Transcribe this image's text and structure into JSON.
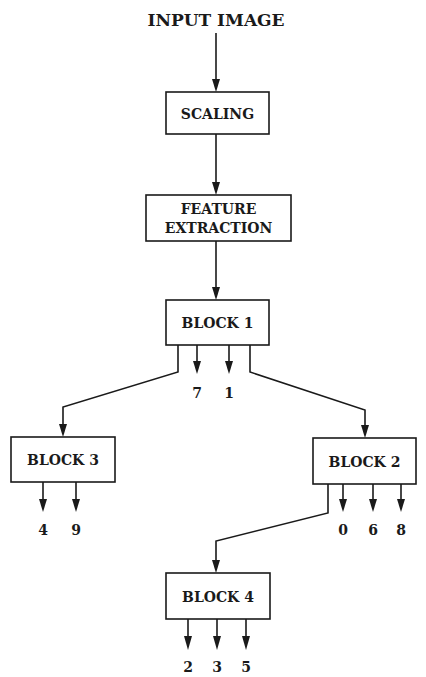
{
  "diagram": {
    "type": "flowchart / decision tree",
    "input_label": "INPUT IMAGE",
    "nodes": {
      "scaling": "SCALING",
      "feature_line1": "FEATURE",
      "feature_line2": "EXTRACTION",
      "block1": "BLOCK 1",
      "block2": "BLOCK 2",
      "block3": "BLOCK 3",
      "block4": "BLOCK 4"
    },
    "outputs": {
      "block1": [
        "7",
        "1"
      ],
      "block3": [
        "4",
        "9"
      ],
      "block2": [
        "0",
        "6",
        "8"
      ],
      "block4": [
        "2",
        "3",
        "5"
      ]
    },
    "edges": [
      {
        "from": "INPUT IMAGE",
        "to": "SCALING"
      },
      {
        "from": "SCALING",
        "to": "FEATURE EXTRACTION"
      },
      {
        "from": "FEATURE EXTRACTION",
        "to": "BLOCK 1"
      },
      {
        "from": "BLOCK 1",
        "to": "BLOCK 3"
      },
      {
        "from": "BLOCK 1",
        "to": "BLOCK 2"
      },
      {
        "from": "BLOCK 2",
        "to": "BLOCK 4"
      }
    ],
    "colors": {
      "ink": "#1a1a1a",
      "background": "#ffffff"
    }
  }
}
